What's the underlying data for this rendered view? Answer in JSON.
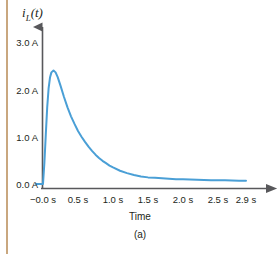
{
  "figure": {
    "caption": "(a)",
    "accent_color": "#4a9fd6",
    "axis_color": "#58585b",
    "text_color": "#231f20",
    "rule_color": "#c9a77f",
    "background": "#ffffff"
  },
  "ylabel": {
    "variable": "i",
    "subscript": "L",
    "argument": "(t)"
  },
  "chart_data": {
    "type": "line",
    "title": "",
    "subtitle": "",
    "xlabel": "Time",
    "ylabel": "i_L(t)",
    "annotations": [
      "(a)"
    ],
    "legend": [],
    "legend_position": "none",
    "grid": false,
    "xlim": [
      -0.12,
      3.05
    ],
    "ylim": [
      -0.12,
      3.35
    ],
    "xtick_values": [
      0.0,
      0.5,
      1.0,
      1.5,
      2.0,
      2.5,
      2.9
    ],
    "xtick_labels": [
      "−0.0 s",
      "0.5 s",
      "1.0 s",
      "1.5 s",
      "2.0 s",
      "2.5 s",
      "2.9 s"
    ],
    "ytick_values": [
      0.0,
      1.0,
      2.0,
      3.0
    ],
    "ytick_labels": [
      "0.0 A",
      "1.0 A",
      "2.0 A",
      "3.0 A"
    ],
    "series": [
      {
        "name": "i_L(t)",
        "color": "#4a9fd6",
        "linewidth": 2,
        "peak_value": 2.4,
        "peak_time": 0.15,
        "x": [
          -0.1,
          -0.02,
          0.0,
          0.02,
          0.04,
          0.06,
          0.08,
          0.1,
          0.12,
          0.15,
          0.18,
          0.21,
          0.25,
          0.3,
          0.35,
          0.4,
          0.45,
          0.5,
          0.55,
          0.6,
          0.65,
          0.7,
          0.75,
          0.8,
          0.85,
          0.9,
          0.95,
          1.0,
          1.1,
          1.2,
          1.3,
          1.4,
          1.5,
          1.6,
          1.7,
          1.8,
          1.9,
          2.0,
          2.2,
          2.4,
          2.6,
          2.8,
          2.9
        ],
        "y": [
          0.0,
          0.0,
          0.0,
          0.45,
          1.05,
          1.62,
          2.02,
          2.25,
          2.36,
          2.4,
          2.36,
          2.26,
          2.08,
          1.84,
          1.62,
          1.43,
          1.27,
          1.12,
          1.0,
          0.89,
          0.79,
          0.7,
          0.62,
          0.55,
          0.49,
          0.44,
          0.39,
          0.35,
          0.28,
          0.23,
          0.19,
          0.16,
          0.14,
          0.13,
          0.12,
          0.11,
          0.1,
          0.1,
          0.09,
          0.08,
          0.08,
          0.07,
          0.07
        ]
      }
    ]
  }
}
